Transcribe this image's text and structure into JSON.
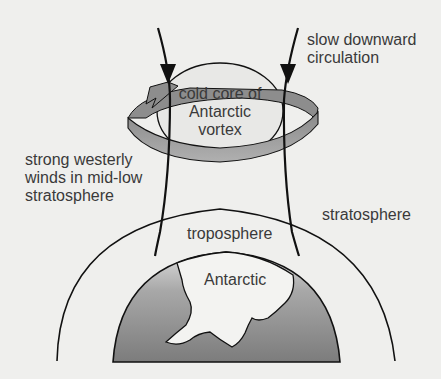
{
  "diagram": {
    "labels": {
      "circulation": [
        "slow downward",
        "circulation"
      ],
      "core": [
        "cold core of",
        "Antarctic",
        "vortex"
      ],
      "winds": [
        "strong westerly",
        "winds in mid-low",
        "stratosphere"
      ],
      "stratosphere": "stratosphere",
      "troposphere": "troposphere",
      "continent": "Antarctic"
    },
    "colors": {
      "background": "#efefed",
      "line": "#111111",
      "arrow_band": "#9a9a9a",
      "earth_top": "#d8d8d8",
      "earth_bottom": "#7a7a7a",
      "text": "#3a3a3a"
    }
  }
}
